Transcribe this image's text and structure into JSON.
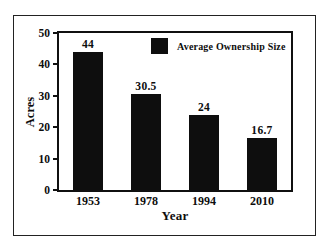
{
  "chart_data": {
    "type": "bar",
    "title": "",
    "categories": [
      "1953",
      "1978",
      "1994",
      "2010"
    ],
    "values": [
      44,
      30.5,
      24,
      16.7
    ],
    "value_labels": [
      "44",
      "30.5",
      "24",
      "16.7"
    ],
    "xlabel": "Year",
    "ylabel": "Acres",
    "ylim": [
      0,
      50
    ],
    "yticks": [
      0,
      10,
      20,
      30,
      40,
      50
    ],
    "grid": false,
    "legend": [
      {
        "label": "Average Ownership Size",
        "color": "#0e0e0e"
      }
    ],
    "legend_position": "inside-top-center",
    "bar_color": "#0e0e0e"
  },
  "colors": {
    "background": "#ffffff",
    "bar": "#0e0e0e",
    "text": "#0d0d0d",
    "outer_frame_border": "#222222",
    "plot_border": "#101010"
  }
}
